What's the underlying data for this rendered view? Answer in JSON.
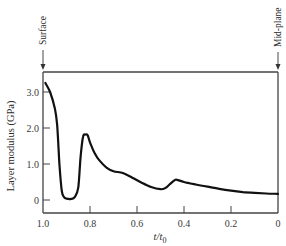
{
  "chart_data": {
    "type": "line",
    "title": "",
    "xlabel": "t/t0",
    "ylabel": "Layer modulus (GPa)",
    "xlim": [
      1.0,
      0
    ],
    "ylim": [
      -0.35,
      3.55
    ],
    "x_reversed": true,
    "grid": false,
    "legend": null,
    "x_ticks": [
      1.0,
      0.8,
      0.6,
      0.4,
      0.2,
      0
    ],
    "x_tick_labels": [
      "1.0",
      "0.8",
      "0.6",
      "0.4",
      "0.2",
      "0"
    ],
    "y_ticks": [
      0,
      1.0,
      2.0,
      3.0
    ],
    "y_tick_labels": [
      "0",
      "1.0",
      "2.0",
      "3.0"
    ],
    "annotations": [
      {
        "text": "Surface",
        "x": 1.0,
        "position": "top-left, vertical text with down arrow"
      },
      {
        "text": "Mid-plane",
        "x": 0,
        "position": "top-right, vertical text with down arrow"
      }
    ],
    "series": [
      {
        "name": "Layer modulus",
        "x": [
          0.99,
          0.97,
          0.95,
          0.94,
          0.93,
          0.92,
          0.91,
          0.9,
          0.88,
          0.865,
          0.85,
          0.84,
          0.83,
          0.82,
          0.81,
          0.8,
          0.78,
          0.76,
          0.73,
          0.7,
          0.66,
          0.62,
          0.58,
          0.54,
          0.5,
          0.48,
          0.46,
          0.44,
          0.43,
          0.4,
          0.35,
          0.3,
          0.25,
          0.2,
          0.15,
          0.1,
          0.05,
          0.0
        ],
        "values": [
          3.25,
          3.0,
          2.55,
          2.1,
          1.0,
          0.25,
          0.08,
          0.04,
          0.03,
          0.08,
          0.35,
          1.2,
          1.75,
          1.82,
          1.8,
          1.6,
          1.3,
          1.1,
          0.9,
          0.8,
          0.75,
          0.62,
          0.48,
          0.36,
          0.3,
          0.33,
          0.44,
          0.55,
          0.56,
          0.5,
          0.43,
          0.37,
          0.31,
          0.26,
          0.22,
          0.2,
          0.18,
          0.17
        ]
      }
    ]
  }
}
